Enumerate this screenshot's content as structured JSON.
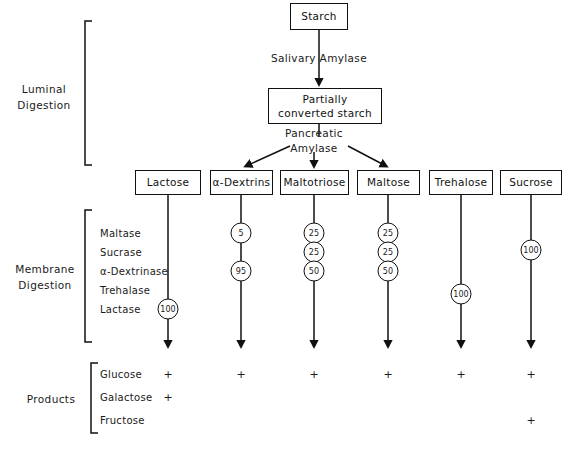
{
  "figure": {
    "sections": [
      {
        "id": "luminal",
        "title": "Luminal\nDigestion"
      },
      {
        "id": "membrane",
        "title": "Membrane\nDigestion"
      },
      {
        "id": "products",
        "title": "Products"
      }
    ],
    "luminal": {
      "start_node": "Starch",
      "enzyme_1": "Salivary Amylase",
      "intermediate_node": "Partially\nconverted starch",
      "enzyme_2": "Pancreatic\nAmylase"
    },
    "substrates": [
      {
        "label": "Lactose",
        "x": 168
      },
      {
        "label": "α-Dextrins",
        "x": 241
      },
      {
        "label": "Maltotriose",
        "x": 314
      },
      {
        "label": "Maltose",
        "x": 388
      },
      {
        "label": "Trehalose",
        "x": 461
      },
      {
        "label": "Sucrose",
        "x": 531
      }
    ],
    "membrane_enzymes": [
      {
        "label": "Maltase",
        "y": 233
      },
      {
        "label": "Sucrase",
        "y": 252
      },
      {
        "label": "α-Dextrinase",
        "y": 271
      },
      {
        "label": "Trehalase",
        "y": 290
      },
      {
        "label": "Lactase",
        "y": 309
      }
    ],
    "activity_values": [
      {
        "substrate": "Lactose",
        "enzyme": "Lactase",
        "value": "100",
        "x": 168,
        "y": 309
      },
      {
        "substrate": "α-Dextrins",
        "enzyme": "Maltase",
        "value": "5",
        "x": 241,
        "y": 233
      },
      {
        "substrate": "α-Dextrins",
        "enzyme": "α-Dextrinase",
        "value": "95",
        "x": 241,
        "y": 271
      },
      {
        "substrate": "Maltotriose",
        "enzyme": "Maltase",
        "value": "25",
        "x": 314,
        "y": 233
      },
      {
        "substrate": "Maltotriose",
        "enzyme": "Sucrase",
        "value": "25",
        "x": 314,
        "y": 252
      },
      {
        "substrate": "Maltotriose",
        "enzyme": "α-Dextrinase",
        "value": "50",
        "x": 314,
        "y": 271
      },
      {
        "substrate": "Maltose",
        "enzyme": "Maltase",
        "value": "25",
        "x": 388,
        "y": 233
      },
      {
        "substrate": "Maltose",
        "enzyme": "Sucrase",
        "value": "25",
        "x": 388,
        "y": 252
      },
      {
        "substrate": "Maltose",
        "enzyme": "α-Dextrinase",
        "value": "50",
        "x": 388,
        "y": 271
      },
      {
        "substrate": "Trehalose",
        "enzyme": "Trehalase",
        "value": "100",
        "x": 461,
        "y": 294
      },
      {
        "substrate": "Sucrose",
        "enzyme": "Sucrase",
        "value": "100",
        "x": 531,
        "y": 250
      }
    ],
    "products": [
      {
        "label": "Glucose",
        "y": 374,
        "marks": [
          168,
          241,
          314,
          388,
          461,
          531
        ]
      },
      {
        "label": "Galactose",
        "y": 397,
        "marks": [
          168
        ]
      },
      {
        "label": "Fructose",
        "y": 420,
        "marks": [
          531
        ]
      }
    ],
    "mark_symbol": "+",
    "colors": {
      "ink": "#111111",
      "background": "#ffffff"
    }
  }
}
